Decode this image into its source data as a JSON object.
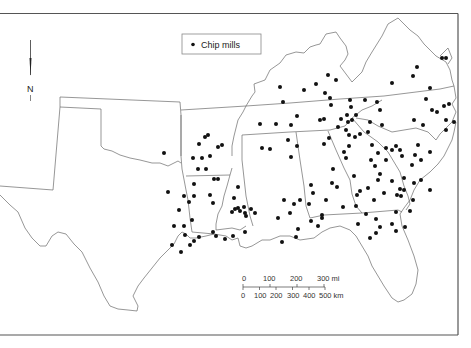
{
  "legend": {
    "label": "Chip mills",
    "symbol": "filled-circle"
  },
  "north_arrow": {
    "label": "N"
  },
  "scale_bar": {
    "miles": {
      "ticks": [
        "0",
        "100",
        "200",
        "300 mi"
      ]
    },
    "km": {
      "ticks": [
        "0",
        "100",
        "200",
        "300",
        "400",
        "500 km"
      ]
    }
  },
  "colors": {
    "dot": "#111111",
    "boundary": "#6a6a6a",
    "frame": "#555555",
    "background": "#ffffff"
  },
  "chip_mills": [
    [
      164,
      153
    ],
    [
      205,
      137
    ],
    [
      208,
      135
    ],
    [
      199,
      144
    ],
    [
      193,
      158
    ],
    [
      202,
      158
    ],
    [
      210,
      156
    ],
    [
      218,
      147
    ],
    [
      222,
      145
    ],
    [
      198,
      169
    ],
    [
      206,
      169
    ],
    [
      214,
      179
    ],
    [
      218,
      179
    ],
    [
      194,
      184
    ],
    [
      168,
      192
    ],
    [
      184,
      196
    ],
    [
      194,
      196
    ],
    [
      210,
      195
    ],
    [
      213,
      203
    ],
    [
      189,
      202
    ],
    [
      179,
      210
    ],
    [
      174,
      226
    ],
    [
      184,
      226
    ],
    [
      192,
      220
    ],
    [
      185,
      235
    ],
    [
      199,
      237
    ],
    [
      194,
      241
    ],
    [
      172,
      245
    ],
    [
      181,
      252
    ],
    [
      190,
      245
    ],
    [
      238,
      187
    ],
    [
      234,
      198
    ],
    [
      238,
      208
    ],
    [
      244,
      207
    ],
    [
      255,
      213
    ],
    [
      245,
      213
    ],
    [
      240,
      211
    ],
    [
      232,
      212
    ],
    [
      235,
      209
    ],
    [
      213,
      232
    ],
    [
      216,
      236
    ],
    [
      225,
      239
    ],
    [
      233,
      236
    ],
    [
      245,
      232
    ],
    [
      251,
      209
    ],
    [
      246,
      216
    ],
    [
      260,
      124
    ],
    [
      276,
      124
    ],
    [
      291,
      125
    ],
    [
      297,
      116
    ],
    [
      288,
      140
    ],
    [
      297,
      146
    ],
    [
      262,
      148
    ],
    [
      270,
      149
    ],
    [
      291,
      157
    ],
    [
      320,
      120
    ],
    [
      324,
      119
    ],
    [
      324,
      144
    ],
    [
      329,
      138
    ],
    [
      344,
      152
    ],
    [
      346,
      158
    ],
    [
      333,
      169
    ],
    [
      332,
      183
    ],
    [
      337,
      187
    ],
    [
      311,
      185
    ],
    [
      300,
      200
    ],
    [
      294,
      204
    ],
    [
      309,
      204
    ],
    [
      313,
      193
    ],
    [
      322,
      218
    ],
    [
      298,
      229
    ],
    [
      296,
      237
    ],
    [
      282,
      242
    ],
    [
      311,
      221
    ],
    [
      318,
      226
    ],
    [
      322,
      215
    ],
    [
      278,
      218
    ],
    [
      284,
      200
    ],
    [
      290,
      213
    ],
    [
      326,
      200
    ],
    [
      343,
      207
    ],
    [
      356,
      206
    ],
    [
      357,
      195
    ],
    [
      360,
      191
    ],
    [
      368,
      188
    ],
    [
      376,
      219
    ],
    [
      380,
      227
    ],
    [
      366,
      214
    ],
    [
      370,
      238
    ],
    [
      376,
      233
    ],
    [
      392,
      224
    ],
    [
      396,
      231
    ],
    [
      405,
      227
    ],
    [
      410,
      211
    ],
    [
      396,
      212
    ],
    [
      358,
      224
    ],
    [
      280,
      87
    ],
    [
      283,
      102
    ],
    [
      304,
      90
    ],
    [
      316,
      84
    ],
    [
      328,
      75
    ],
    [
      325,
      93
    ],
    [
      331,
      105
    ],
    [
      336,
      80
    ],
    [
      330,
      98
    ],
    [
      347,
      115
    ],
    [
      350,
      100
    ],
    [
      351,
      107
    ],
    [
      356,
      115
    ],
    [
      365,
      100
    ],
    [
      377,
      102
    ],
    [
      380,
      110
    ],
    [
      370,
      122
    ],
    [
      360,
      134
    ],
    [
      368,
      132
    ],
    [
      382,
      125
    ],
    [
      372,
      145
    ],
    [
      386,
      148
    ],
    [
      392,
      150
    ],
    [
      396,
      146
    ],
    [
      400,
      150
    ],
    [
      402,
      156
    ],
    [
      386,
      160
    ],
    [
      380,
      174
    ],
    [
      384,
      193
    ],
    [
      378,
      180
    ],
    [
      374,
      200
    ],
    [
      354,
      176
    ],
    [
      338,
      127
    ],
    [
      346,
      130
    ],
    [
      349,
      135
    ],
    [
      341,
      119
    ],
    [
      348,
      122
    ],
    [
      352,
      120
    ],
    [
      355,
      137
    ],
    [
      349,
      146
    ],
    [
      371,
      160
    ],
    [
      375,
      166
    ],
    [
      378,
      153
    ],
    [
      392,
      83
    ],
    [
      413,
      76
    ],
    [
      417,
      67
    ],
    [
      426,
      99
    ],
    [
      430,
      88
    ],
    [
      442,
      58
    ],
    [
      446,
      58
    ],
    [
      432,
      110
    ],
    [
      437,
      112
    ],
    [
      444,
      106
    ],
    [
      449,
      104
    ],
    [
      446,
      120
    ],
    [
      454,
      122
    ],
    [
      446,
      130
    ],
    [
      414,
      120
    ],
    [
      430,
      152
    ],
    [
      423,
      125
    ],
    [
      418,
      145
    ],
    [
      415,
      155
    ],
    [
      421,
      160
    ],
    [
      412,
      165
    ],
    [
      404,
      178
    ],
    [
      404,
      190
    ],
    [
      400,
      189
    ],
    [
      401,
      196
    ],
    [
      397,
      195
    ],
    [
      392,
      181
    ],
    [
      413,
      200
    ],
    [
      414,
      183
    ],
    [
      430,
      190
    ],
    [
      421,
      180
    ]
  ]
}
